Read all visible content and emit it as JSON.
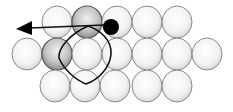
{
  "diagram": {
    "colors": {
      "background": "#ffffff",
      "atom_fill_light": "#f4f4f4",
      "atom_fill_edge": "#dcdcdc",
      "atom_stroke": "#8a8a8a",
      "atom_shaded_fill": "#c8c8c8",
      "atom_shaded_stroke": "#555555",
      "adatom": "#000000",
      "path_stroke": "#111111"
    },
    "atom_radius": {
      "rx": 15,
      "ry": 16
    },
    "rows": [
      {
        "name": "top-row",
        "y": 22,
        "x": [
          57,
          87,
          117,
          147,
          177
        ],
        "shaded": [
          87
        ]
      },
      {
        "name": "middle-row",
        "y": 54,
        "x": [
          27,
          57,
          87,
          117,
          147,
          177,
          207
        ],
        "shaded": [
          57
        ]
      },
      {
        "name": "bottom-row",
        "y": 86,
        "x": [
          55,
          85,
          115,
          147,
          177
        ],
        "shaded": []
      }
    ],
    "adatom": {
      "cx": 111,
      "cy": 27,
      "r": 8
    },
    "arrow": {
      "x1": 104,
      "y1": 25,
      "x2": 30,
      "y2": 28,
      "tip_x": 16,
      "tip_y": 29
    },
    "loop_path": "M 88 26 C 100 30, 112 40, 111 54 C 110 68, 98 80, 86 84 C 76 80, 64 70, 59 58 C 58 48, 70 34, 88 26 Z"
  }
}
